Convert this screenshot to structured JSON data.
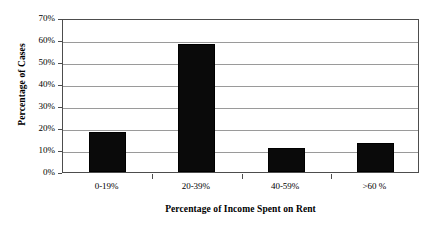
{
  "chart_data": {
    "type": "bar",
    "title": "",
    "categories": [
      "0-19%",
      "20-39%",
      "40-59%",
      ">60 %"
    ],
    "values": [
      18,
      58,
      11,
      13
    ],
    "series": [
      {
        "name": "Percentage of Cases",
        "values": [
          18,
          58,
          11,
          13
        ]
      }
    ],
    "xlabel": "Percentage of Income Spent on Rent",
    "ylabel": "Percentage of Cases",
    "ylim": [
      0,
      70
    ],
    "ytick_labels": [
      "0%",
      "10%",
      "20%",
      "30%",
      "40%",
      "50%",
      "60%",
      "70%"
    ],
    "ytick_values": [
      0,
      10,
      20,
      30,
      40,
      50,
      60,
      70
    ],
    "grid": "horizontal",
    "legend": "none",
    "bar_color": "#0a0a0a",
    "axis_color": "#4d4d4d",
    "gridline_color": "#9a9a9a",
    "background_color": "#ffffff"
  }
}
